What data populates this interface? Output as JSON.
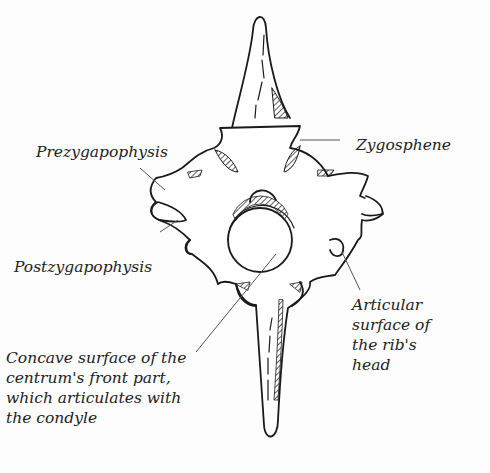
{
  "diagram": {
    "labels": {
      "prezygapophysis": "Prezygapophysis",
      "zygosphene": "Zygosphene",
      "postzygapophysis": "Postzygapophysis",
      "articular_line1": "Articular",
      "articular_line2": "surface of",
      "articular_line3": "the rib's",
      "articular_line4": "head",
      "concave_line1": "Concave surface of the",
      "concave_line2": "centrum's front part,",
      "concave_line3": "which articulates with",
      "concave_line4": "the condyle"
    },
    "colors": {
      "ink": "#1a1a1a",
      "leader": "#555555",
      "background": "#fdfdfd"
    }
  }
}
